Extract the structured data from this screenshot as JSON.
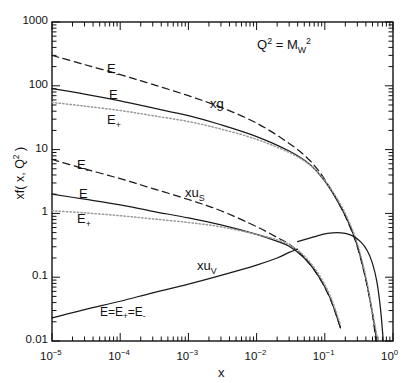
{
  "figure": {
    "annotation": "Q² = M_W²",
    "annotation_parts": {
      "base1": "Q",
      "exp1": "2",
      "eq": " = ",
      "base2": "M",
      "sub2": "W",
      "exp2": "2"
    }
  },
  "axes": {
    "xlabel": "x",
    "ylabel": "xf( x, Q² )",
    "ylabel_parts": {
      "pre": "xf( x, Q",
      "exp": "2",
      "post": " )"
    },
    "xlim": [
      1e-05,
      1
    ],
    "ylim": [
      0.01,
      1000
    ],
    "xscale": "log",
    "yscale": "log",
    "xticklabels": [
      "10⁻⁵",
      "10⁻⁴",
      "10⁻³",
      "10⁻²",
      "10⁻¹",
      "10⁰"
    ],
    "xtick_exponents": [
      "-5",
      "-4",
      "-3",
      "-2",
      "-1",
      "0"
    ],
    "xtick_mantissa": "10",
    "yticklabels": [
      "0.01",
      "0.1",
      "1",
      "10",
      "100",
      "1000"
    ],
    "ytickvalues": [
      0.01,
      0.1,
      1,
      10,
      100,
      1000
    ],
    "grid": false
  },
  "curve_labels": {
    "gluon": "xg",
    "sea": "xu",
    "sea_sub": "S",
    "valence": "xu",
    "valence_sub": "V",
    "e_minus": "E₋",
    "e_nominal": "E",
    "e_plus": "E₊",
    "valence_note": "E=E₊=E₋",
    "valence_note_parts": {
      "a": "E=E",
      "s1": "+",
      "b": "=E",
      "s2": "-"
    },
    "e_minus_parts": {
      "a": "E",
      "s": "-"
    },
    "e_plus_parts": {
      "a": "E",
      "s": "+"
    }
  },
  "colors": {
    "axis": "#111111",
    "line": "#1a1a1a",
    "dotted": "#9a9a9a",
    "background": "#ffffff"
  },
  "chart_data": {
    "type": "line",
    "title": "",
    "subtitle": "",
    "xlabel": "x",
    "ylabel": "xf( x, Q² )",
    "xscale": "log",
    "yscale": "log",
    "xlim": [
      1e-05,
      1
    ],
    "ylim": [
      0.01,
      1000
    ],
    "grid": false,
    "legend_position": "inline-annotations",
    "annotations": [
      {
        "text": "Q² = M_W²",
        "x": 0.02,
        "y": 430
      },
      {
        "text": "xg",
        "x": 0.0045,
        "y": 30
      },
      {
        "text": "xu_S",
        "x": 0.0012,
        "y": 1.55
      },
      {
        "text": "xu_V",
        "x": 0.0035,
        "y": 0.075
      },
      {
        "text": "E=E₊=E₋",
        "x": 0.00022,
        "y": 0.022
      },
      {
        "text": "E₋",
        "x": 0.00016,
        "y": 175
      },
      {
        "text": "E",
        "x": 0.00016,
        "y": 62
      },
      {
        "text": "E₊",
        "x": 0.00016,
        "y": 22
      },
      {
        "text": "E₋",
        "x": 4.5e-05,
        "y": 5.2
      },
      {
        "text": "E",
        "x": 4.5e-05,
        "y": 1.9
      },
      {
        "text": "E₊",
        "x": 4.5e-05,
        "y": 0.72
      }
    ],
    "series": [
      {
        "name": "xg (E-)",
        "style": "dashed",
        "x": [
          1e-05,
          3e-05,
          0.0001,
          0.0003,
          0.001,
          0.003,
          0.01,
          0.03,
          0.06,
          0.1,
          0.16,
          0.22,
          0.3,
          0.4,
          0.5,
          0.56
        ],
        "y": [
          300,
          215,
          150,
          105,
          70,
          46,
          26,
          12.5,
          6.8,
          3.4,
          1.45,
          0.72,
          0.3,
          0.09,
          0.026,
          0.01
        ]
      },
      {
        "name": "xg (E)",
        "style": "solid",
        "x": [
          1e-05,
          3e-05,
          0.0001,
          0.0003,
          0.001,
          0.003,
          0.01,
          0.03,
          0.06,
          0.1,
          0.16,
          0.22,
          0.3,
          0.4,
          0.5,
          0.58
        ],
        "y": [
          90,
          74,
          58,
          45,
          34,
          24.5,
          16,
          9.5,
          5.9,
          3.2,
          1.45,
          0.74,
          0.31,
          0.094,
          0.027,
          0.01
        ]
      },
      {
        "name": "xg (E+)",
        "style": "dotted",
        "x": [
          1e-05,
          3e-05,
          0.0001,
          0.0003,
          0.001,
          0.003,
          0.01,
          0.03,
          0.06,
          0.1,
          0.16,
          0.22,
          0.3,
          0.4,
          0.5,
          0.6
        ],
        "y": [
          55,
          48,
          41,
          34,
          27.5,
          21,
          14.5,
          9.0,
          5.8,
          3.3,
          1.55,
          0.8,
          0.34,
          0.102,
          0.029,
          0.01
        ]
      },
      {
        "name": "xu_S (E-)",
        "style": "dashed",
        "x": [
          1e-05,
          3e-05,
          0.0001,
          0.0003,
          0.001,
          0.003,
          0.01,
          0.02,
          0.03,
          0.05,
          0.08,
          0.12,
          0.17,
          0.22,
          0.26
        ],
        "y": [
          7.0,
          5.0,
          3.5,
          2.45,
          1.65,
          1.1,
          0.62,
          0.42,
          0.33,
          0.205,
          0.105,
          0.046,
          0.016,
          0.0048,
          0.0018
        ]
      },
      {
        "name": "xu_S (E)",
        "style": "solid",
        "x": [
          1e-05,
          3e-05,
          0.0001,
          0.0003,
          0.001,
          0.003,
          0.01,
          0.02,
          0.03,
          0.05,
          0.08,
          0.12,
          0.17,
          0.22,
          0.26
        ],
        "y": [
          2.0,
          1.67,
          1.36,
          1.08,
          0.85,
          0.66,
          0.47,
          0.365,
          0.305,
          0.2,
          0.106,
          0.047,
          0.016,
          0.0048,
          0.0018
        ]
      },
      {
        "name": "xu_S (E+)",
        "style": "dotted",
        "x": [
          1e-05,
          3e-05,
          0.0001,
          0.0003,
          0.001,
          0.003,
          0.01,
          0.02,
          0.03,
          0.05,
          0.08,
          0.12,
          0.17,
          0.22,
          0.27
        ],
        "y": [
          1.1,
          1.02,
          0.92,
          0.82,
          0.72,
          0.615,
          0.47,
          0.385,
          0.325,
          0.215,
          0.115,
          0.051,
          0.018,
          0.0053,
          0.0018
        ]
      },
      {
        "name": "xu_V",
        "style": "solid",
        "x": [
          1e-05,
          3e-05,
          0.0001,
          0.0003,
          0.001,
          0.003,
          0.01,
          0.02,
          0.03,
          0.04
        ],
        "y": [
          0.023,
          0.031,
          0.042,
          0.057,
          0.078,
          0.107,
          0.155,
          0.2,
          0.245,
          0.275
        ]
      },
      {
        "name": "xu_V peak",
        "style": "solid",
        "x": [
          0.04,
          0.06,
          0.08,
          0.11,
          0.15,
          0.2,
          0.26,
          0.34,
          0.42,
          0.5,
          0.58,
          0.66,
          0.72
        ],
        "y": [
          0.36,
          0.41,
          0.45,
          0.485,
          0.5,
          0.485,
          0.44,
          0.355,
          0.26,
          0.165,
          0.085,
          0.03,
          0.01
        ]
      }
    ]
  }
}
